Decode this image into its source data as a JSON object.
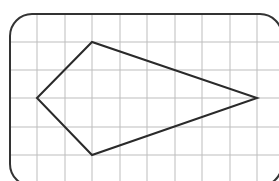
{
  "diagram": {
    "type": "grid-polygon",
    "frame": {
      "x": 10,
      "y": 14,
      "width": 272,
      "height": 172,
      "radius": 22,
      "stroke": "#333333"
    },
    "grid": {
      "vertical_lines_x": [
        37,
        65,
        92,
        120,
        147,
        175,
        202,
        230,
        257
      ],
      "horizontal_lines_y": [
        42,
        70,
        98,
        127,
        155
      ],
      "cell_size": 28,
      "stroke": "#bdbdbd"
    },
    "shape": {
      "name": "kite",
      "vertices": [
        {
          "label": "left",
          "x": 37,
          "y": 98,
          "grid": [
            0,
            2
          ]
        },
        {
          "label": "top",
          "x": 92,
          "y": 42,
          "grid": [
            2,
            0
          ]
        },
        {
          "label": "right",
          "x": 257,
          "y": 98,
          "grid": [
            8,
            2
          ]
        },
        {
          "label": "bottom",
          "x": 92,
          "y": 155,
          "grid": [
            2,
            4
          ]
        }
      ],
      "stroke": "#2a2a2a"
    }
  }
}
